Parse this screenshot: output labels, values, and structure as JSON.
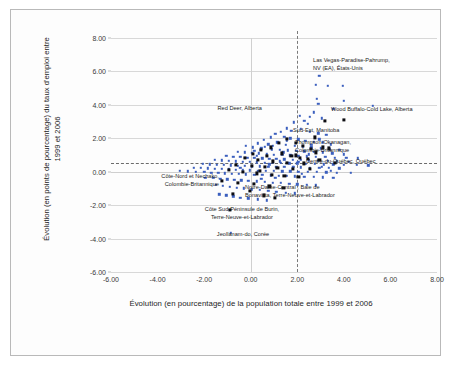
{
  "figure": {
    "kind": "scatter-plot-figure"
  },
  "chart_data": {
    "type": "scatter",
    "title": "",
    "xlabel": "Évolution (en pourcentage) de la population totale entre 1999 et 2006",
    "ylabel": "Évolution (en points de pourcentage) du taux d'emploi entre 1999 et 2006",
    "xlim": [
      -6.0,
      8.0
    ],
    "ylim": [
      -6.0,
      8.0
    ],
    "xticks": [
      "-6.00",
      "-4.00",
      "-2.00",
      "0.00",
      "2.00",
      "4.00",
      "6.00",
      "8.00"
    ],
    "xtick_values": [
      -6,
      -4,
      -2,
      0,
      2,
      4,
      6,
      8
    ],
    "yticks": [
      "-6.00",
      "-4.00",
      "-2.00",
      "0.00",
      "2.00",
      "4.00",
      "6.00",
      "8.00"
    ],
    "ytick_values": [
      -6,
      -4,
      -2,
      0,
      2,
      4,
      6,
      8
    ],
    "grid": true,
    "legend": "none",
    "colors": {
      "series_other": "#3b5fbe",
      "series_canada": "#0d0d12",
      "reference_line": "#6b6b6b",
      "gridline": "#d8d8d8",
      "frame": "#b9b9b9"
    },
    "reference_lines": [
      {
        "orientation": "horizontal",
        "value": 0.55,
        "style": "dashed"
      },
      {
        "orientation": "vertical",
        "value": 2.0,
        "style": "dashed"
      }
    ],
    "series": [
      {
        "name": "Autres régions (OCDE)",
        "marker": "small-square",
        "color": "#3b5fbe",
        "points": [
          [
            2.95,
            5.75
          ],
          [
            3.3,
            5.15
          ],
          [
            3.95,
            5.15
          ],
          [
            2.8,
            5.2
          ],
          [
            2.85,
            4.35
          ],
          [
            2.9,
            4.05
          ],
          [
            4.0,
            4.25
          ],
          [
            5.25,
            3.95
          ],
          [
            3.55,
            3.75
          ],
          [
            2.7,
            3.55
          ],
          [
            2.55,
            3.3
          ],
          [
            3.05,
            3.2
          ],
          [
            2.1,
            3.35
          ],
          [
            2.3,
            3.05
          ],
          [
            2.45,
            2.85
          ],
          [
            1.85,
            2.95
          ],
          [
            1.55,
            2.6
          ],
          [
            1.75,
            2.45
          ],
          [
            2.15,
            2.55
          ],
          [
            2.55,
            2.4
          ],
          [
            2.9,
            2.3
          ],
          [
            3.25,
            2.2
          ],
          [
            1.3,
            2.4
          ],
          [
            1.05,
            2.25
          ],
          [
            0.85,
            2.05
          ],
          [
            1.45,
            2.1
          ],
          [
            1.7,
            2.0
          ],
          [
            2.05,
            1.95
          ],
          [
            2.35,
            1.85
          ],
          [
            2.7,
            1.8
          ],
          [
            3.1,
            1.75
          ],
          [
            3.45,
            1.65
          ],
          [
            0.55,
            1.9
          ],
          [
            0.3,
            1.7
          ],
          [
            0.75,
            1.65
          ],
          [
            1.15,
            1.75
          ],
          [
            1.5,
            1.6
          ],
          [
            1.9,
            1.55
          ],
          [
            2.25,
            1.5
          ],
          [
            2.6,
            1.45
          ],
          [
            3.0,
            1.4
          ],
          [
            3.4,
            1.35
          ],
          [
            3.8,
            1.3
          ],
          [
            -0.2,
            1.55
          ],
          [
            0.1,
            1.45
          ],
          [
            0.45,
            1.4
          ],
          [
            0.9,
            1.35
          ],
          [
            1.25,
            1.3
          ],
          [
            1.6,
            1.28
          ],
          [
            1.95,
            1.25
          ],
          [
            2.3,
            1.22
          ],
          [
            2.7,
            1.18
          ],
          [
            3.1,
            1.15
          ],
          [
            3.5,
            1.1
          ],
          [
            4.0,
            1.05
          ],
          [
            -0.55,
            1.2
          ],
          [
            -0.25,
            1.15
          ],
          [
            0.05,
            1.12
          ],
          [
            0.35,
            1.1
          ],
          [
            0.7,
            1.05
          ],
          [
            1.0,
            1.02
          ],
          [
            1.35,
            1.0
          ],
          [
            1.7,
            0.98
          ],
          [
            2.05,
            0.95
          ],
          [
            2.4,
            0.92
          ],
          [
            2.8,
            0.9
          ],
          [
            3.2,
            0.88
          ],
          [
            3.6,
            0.85
          ],
          [
            4.1,
            0.82
          ],
          [
            4.6,
            0.8
          ],
          [
            -1.05,
            0.95
          ],
          [
            -0.75,
            0.9
          ],
          [
            -0.45,
            0.88
          ],
          [
            -0.15,
            0.85
          ],
          [
            0.15,
            0.82
          ],
          [
            0.5,
            0.8
          ],
          [
            0.8,
            0.78
          ],
          [
            1.1,
            0.76
          ],
          [
            1.45,
            0.74
          ],
          [
            1.8,
            0.72
          ],
          [
            2.15,
            0.7
          ],
          [
            2.5,
            0.68
          ],
          [
            2.9,
            0.66
          ],
          [
            3.3,
            0.64
          ],
          [
            3.7,
            0.62
          ],
          [
            4.2,
            0.6
          ],
          [
            -1.55,
            0.7
          ],
          [
            -1.25,
            0.68
          ],
          [
            -0.95,
            0.65
          ],
          [
            -0.65,
            0.62
          ],
          [
            -0.35,
            0.6
          ],
          [
            -0.05,
            0.58
          ],
          [
            0.25,
            0.56
          ],
          [
            0.6,
            0.55
          ],
          [
            0.95,
            0.54
          ],
          [
            1.3,
            0.52
          ],
          [
            1.65,
            0.5
          ],
          [
            2.0,
            0.5
          ],
          [
            2.35,
            0.48
          ],
          [
            2.75,
            0.46
          ],
          [
            3.15,
            0.45
          ],
          [
            3.55,
            0.44
          ],
          [
            4.0,
            0.42
          ],
          [
            4.55,
            0.4
          ],
          [
            5.05,
            0.38
          ],
          [
            -2.05,
            0.48
          ],
          [
            -1.75,
            0.45
          ],
          [
            -1.45,
            0.42
          ],
          [
            -1.15,
            0.4
          ],
          [
            -0.85,
            0.38
          ],
          [
            -0.55,
            0.36
          ],
          [
            -0.25,
            0.34
          ],
          [
            0.05,
            0.33
          ],
          [
            0.4,
            0.32
          ],
          [
            0.75,
            0.3
          ],
          [
            1.1,
            0.29
          ],
          [
            1.45,
            0.28
          ],
          [
            1.8,
            0.27
          ],
          [
            2.15,
            0.26
          ],
          [
            2.55,
            0.25
          ],
          [
            2.95,
            0.24
          ],
          [
            3.35,
            0.22
          ],
          [
            3.8,
            0.2
          ],
          [
            -2.45,
            0.25
          ],
          [
            -2.15,
            0.22
          ],
          [
            -1.85,
            0.2
          ],
          [
            -1.55,
            0.18
          ],
          [
            -1.25,
            0.16
          ],
          [
            -0.95,
            0.14
          ],
          [
            -0.65,
            0.12
          ],
          [
            -0.35,
            0.1
          ],
          [
            -0.05,
            0.08
          ],
          [
            0.3,
            0.06
          ],
          [
            0.65,
            0.05
          ],
          [
            1.0,
            0.04
          ],
          [
            1.35,
            0.03
          ],
          [
            1.7,
            0.02
          ],
          [
            2.05,
            0.01
          ],
          [
            2.45,
            0.0
          ],
          [
            2.85,
            -0.02
          ],
          [
            3.25,
            -0.04
          ],
          [
            3.7,
            -0.06
          ],
          [
            4.3,
            -0.08
          ],
          [
            -3.05,
            0.05
          ],
          [
            -2.7,
            0.02
          ],
          [
            -2.35,
            0.0
          ],
          [
            -2.0,
            -0.02
          ],
          [
            -1.7,
            -0.05
          ],
          [
            -1.4,
            -0.08
          ],
          [
            -1.1,
            -0.1
          ],
          [
            -0.8,
            -0.12
          ],
          [
            -0.5,
            -0.14
          ],
          [
            -0.2,
            -0.16
          ],
          [
            0.15,
            -0.18
          ],
          [
            0.5,
            -0.2
          ],
          [
            0.85,
            -0.22
          ],
          [
            1.2,
            -0.24
          ],
          [
            1.55,
            -0.26
          ],
          [
            1.9,
            -0.28
          ],
          [
            2.3,
            -0.3
          ],
          [
            2.7,
            -0.32
          ],
          [
            3.1,
            -0.34
          ],
          [
            3.55,
            -0.36
          ],
          [
            -1.95,
            -0.35
          ],
          [
            -1.6,
            -0.38
          ],
          [
            -1.3,
            -0.42
          ],
          [
            -1.0,
            -0.45
          ],
          [
            -0.7,
            -0.48
          ],
          [
            -0.4,
            -0.52
          ],
          [
            -0.1,
            -0.55
          ],
          [
            0.25,
            -0.58
          ],
          [
            0.6,
            -0.62
          ],
          [
            0.95,
            -0.65
          ],
          [
            1.3,
            -0.68
          ],
          [
            1.65,
            -0.72
          ],
          [
            2.0,
            -0.75
          ],
          [
            2.4,
            -0.78
          ],
          [
            2.8,
            -0.82
          ],
          [
            -1.5,
            -0.8
          ],
          [
            -1.2,
            -0.85
          ],
          [
            -0.9,
            -0.9
          ],
          [
            -0.6,
            -0.95
          ],
          [
            -0.3,
            -1.0
          ],
          [
            0.05,
            -1.05
          ],
          [
            0.4,
            -1.1
          ],
          [
            0.75,
            -1.15
          ],
          [
            1.1,
            -1.2
          ],
          [
            1.5,
            -1.25
          ],
          [
            1.9,
            -1.3
          ],
          [
            -1.35,
            -1.35
          ],
          [
            -1.05,
            -1.42
          ],
          [
            -0.75,
            -1.48
          ],
          [
            -0.45,
            -1.55
          ],
          [
            -0.1,
            -1.6
          ],
          [
            0.3,
            -1.65
          ],
          [
            0.7,
            -1.7
          ],
          [
            -0.85,
            -3.65
          ],
          [
            1.55,
            1.85
          ],
          [
            0.95,
            1.55
          ],
          [
            0.25,
            0.95
          ],
          [
            -0.45,
            0.25
          ],
          [
            1.25,
            0.62
          ],
          [
            2.6,
            1.6
          ],
          [
            2.95,
            1.95
          ],
          [
            1.05,
            -0.35
          ],
          [
            0.45,
            -0.42
          ],
          [
            1.85,
            0.3
          ],
          [
            2.2,
            -0.12
          ],
          [
            3.05,
            0.3
          ],
          [
            3.45,
            0.05
          ],
          [
            0.15,
            1.25
          ],
          [
            0.6,
            1.48
          ],
          [
            1.4,
            1.15
          ],
          [
            2.05,
            0.6
          ],
          [
            2.5,
            1.05
          ],
          [
            0.8,
            0.45
          ]
        ]
      },
      {
        "name": "Régions du Canada",
        "marker": "large-square",
        "color": "#0d0d12",
        "points": [
          [
            3.2,
            3.05
          ],
          [
            4.0,
            3.1
          ],
          [
            2.75,
            2.05
          ],
          [
            3.1,
            1.45
          ],
          [
            3.35,
            1.4
          ],
          [
            1.55,
            1.95
          ],
          [
            1.2,
            1.7
          ],
          [
            0.85,
            1.45
          ],
          [
            1.95,
            1.7
          ],
          [
            2.25,
            1.55
          ],
          [
            2.6,
            1.35
          ],
          [
            0.45,
            1.3
          ],
          [
            0.1,
            1.05
          ],
          [
            0.7,
            0.95
          ],
          [
            1.35,
            1.1
          ],
          [
            1.75,
            0.95
          ],
          [
            2.1,
            0.85
          ],
          [
            2.45,
            0.75
          ],
          [
            2.95,
            0.7
          ],
          [
            -0.25,
            0.85
          ],
          [
            0.3,
            0.7
          ],
          [
            0.95,
            0.62
          ],
          [
            1.55,
            0.55
          ],
          [
            2.3,
            0.5
          ],
          [
            3.6,
            0.52
          ],
          [
            -0.65,
            0.4
          ],
          [
            0.05,
            0.35
          ],
          [
            0.6,
            0.28
          ],
          [
            1.15,
            0.22
          ],
          [
            1.8,
            0.18
          ],
          [
            2.55,
            0.15
          ],
          [
            -0.95,
            0.1
          ],
          [
            -0.35,
            0.0
          ],
          [
            0.25,
            -0.1
          ],
          [
            0.9,
            -0.18
          ],
          [
            1.45,
            -0.25
          ],
          [
            2.05,
            -0.32
          ],
          [
            -1.25,
            -0.55
          ],
          [
            -0.55,
            -0.65
          ],
          [
            0.15,
            -0.75
          ],
          [
            0.8,
            -0.88
          ],
          [
            1.4,
            -0.95
          ],
          [
            -0.75,
            -1.35
          ],
          [
            -0.05,
            -1.15
          ],
          [
            0.55,
            -1.42
          ],
          [
            1.05,
            -1.55
          ],
          [
            -0.9,
            -2.3
          ],
          [
            1.95,
            0.98
          ],
          [
            2.8,
            1.15
          ],
          [
            0.4,
            0.05
          ]
        ]
      }
    ],
    "annotations": [
      {
        "id": "las-vegas",
        "text": "Las Vegas-Paradise-Pahrump,\nNV (EA), États-Unis",
        "align": "left",
        "x_px": 313,
        "y_px": 57
      },
      {
        "id": "red-deer",
        "text": "Red Deer, Alberta",
        "align": "right",
        "x_px": 262,
        "y_px": 105
      },
      {
        "id": "wood-buffalo",
        "text": "Wood Buffalo-Cold Lake, Alberta",
        "align": "left",
        "x_px": 331,
        "y_px": 106
      },
      {
        "id": "sud-est-manitoba",
        "text": "Sud-Est, Manitoba",
        "align": "left",
        "x_px": 293,
        "y_px": 127
      },
      {
        "id": "thompson-okanagan",
        "text": "Thompson-Okanagan,\nColombie-Britannique",
        "align": "left",
        "x_px": 295,
        "y_px": 139
      },
      {
        "id": "centre-du-quebec",
        "text": "Centre-du-Québec, Québec",
        "align": "left",
        "x_px": 306,
        "y_px": 158
      },
      {
        "id": "cote-nord-nechako",
        "text": "Côte-Nord et Nechako,\nColombie-Britannique",
        "align": "right",
        "x_px": 219,
        "y_px": 173
      },
      {
        "id": "notre-dame-central",
        "text": "Notre-Dame-Central ; Baie de\nBonavista, Terre-Neuve-et-Labrador",
        "align": "left",
        "x_px": 245,
        "y_px": 184
      },
      {
        "id": "cote-sud-burin",
        "text": "Côte Sud-Péninsule de Burin,\nTerre-Neuve-et-Labrador",
        "align": "center",
        "x_px": 242,
        "y_px": 206
      },
      {
        "id": "jeollanam-do",
        "text": "Jeollanam-do, Corée",
        "align": "center",
        "x_px": 243,
        "y_px": 231
      }
    ]
  }
}
